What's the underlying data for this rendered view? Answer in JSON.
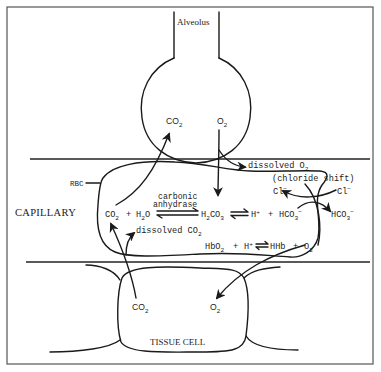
{
  "labels": {
    "alveolus": "Alveolus",
    "capillary": "CAPILLARY",
    "tissue_cell": "TISSUE CELL",
    "rbc": "RBC"
  },
  "alveolus": {
    "co2": {
      "main": "CO",
      "sub": "2"
    },
    "o2": {
      "main": "O",
      "sub": "2"
    }
  },
  "tissue": {
    "co2": {
      "main": "CO",
      "sub": "2"
    },
    "o2": {
      "main": "O",
      "sub": "2"
    }
  },
  "rbc_contents": {
    "dissolved_o2": {
      "text": "dissolved O",
      "sub": "2"
    },
    "chloride_shift": "(chloride shift)",
    "cl_left": {
      "main": "Cl",
      "sup": "−"
    },
    "cl_right": {
      "main": "Cl",
      "sup": "−"
    },
    "enzyme_line1": "carbonic",
    "enzyme_line2": "anhydrase",
    "reaction1": {
      "co2": {
        "main": "CO",
        "sub": "2"
      },
      "plus1": "+",
      "h2o": {
        "main": "H",
        "sub": "2",
        "tail": "O"
      },
      "h2co3": {
        "main": "H",
        "sub": "2",
        "mid": "CO",
        "sub2": "3"
      },
      "h": {
        "main": "H",
        "sup": "+"
      },
      "plus2": "+",
      "hco3": {
        "main": "HCO",
        "sub": "3",
        "sup": "−"
      }
    },
    "hco3_out": {
      "main": "HCO",
      "sub": "3",
      "sup": "−"
    },
    "dissolved_co2": {
      "text": "dissolved CO",
      "sub": "2"
    },
    "reaction2": {
      "hbo2": {
        "main": "HbO",
        "sub": "2"
      },
      "plus1": "+",
      "h": {
        "main": "H",
        "sup": "+"
      },
      "hhb": "HHb",
      "plus2": "+",
      "o2": {
        "main": "O",
        "sub": "2"
      }
    }
  },
  "colors": {
    "ink": "#1a1a1a",
    "background": "#ffffff",
    "frame": "#555555"
  }
}
